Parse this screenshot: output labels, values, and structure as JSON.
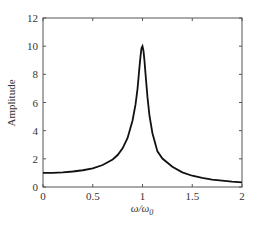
{
  "chart_data": {
    "type": "line",
    "title": "",
    "xlabel": "ω/ω0",
    "xlabel_main": "ω/ω",
    "xlabel_sub": "0",
    "ylabel": "Amplitude",
    "xlim": [
      0,
      2
    ],
    "ylim": [
      0,
      12
    ],
    "xticks": [
      0,
      0.5,
      1,
      1.5,
      2
    ],
    "xtick_labels": [
      "0",
      "0.5",
      "1",
      "1.5",
      "2"
    ],
    "yticks": [
      0,
      2,
      4,
      6,
      8,
      10,
      12
    ],
    "ytick_labels": [
      "0",
      "2",
      "4",
      "6",
      "8",
      "10",
      "12"
    ],
    "grid": false,
    "legend": null,
    "series": [
      {
        "name": "Amplitude",
        "color": "#111111",
        "x": [
          0,
          0.1,
          0.2,
          0.3,
          0.4,
          0.5,
          0.6,
          0.7,
          0.75,
          0.8,
          0.85,
          0.9,
          0.93,
          0.95,
          0.97,
          0.98,
          0.99,
          1.0,
          1.01,
          1.02,
          1.03,
          1.05,
          1.07,
          1.1,
          1.15,
          1.2,
          1.3,
          1.4,
          1.5,
          1.6,
          1.7,
          1.8,
          1.9,
          2.0
        ],
        "y": [
          1.0,
          1.01,
          1.04,
          1.1,
          1.19,
          1.33,
          1.56,
          1.95,
          2.27,
          2.75,
          3.48,
          4.72,
          5.86,
          6.97,
          8.55,
          9.27,
          9.86,
          10.0,
          9.67,
          8.96,
          8.06,
          6.38,
          5.06,
          3.82,
          2.53,
          2.02,
          1.44,
          1.04,
          0.8,
          0.64,
          0.53,
          0.45,
          0.38,
          0.33
        ]
      }
    ],
    "annotations": []
  }
}
